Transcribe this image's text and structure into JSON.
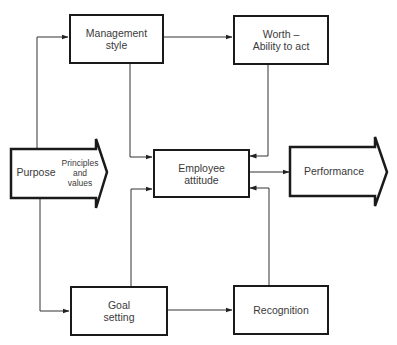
{
  "diagram": {
    "nodes": {
      "management": {
        "label_line1": "Management",
        "label_line2": "style"
      },
      "worth": {
        "label_line1": "Worth –",
        "label_line2": "Ability to act"
      },
      "purpose": {
        "label": "Purpose",
        "sub_line1": "Principles",
        "sub_line2": "and",
        "sub_line3": "values"
      },
      "employee": {
        "label_line1": "Employee",
        "label_line2": "attitude"
      },
      "performance": {
        "label": "Performance"
      },
      "goal": {
        "label_line1": "Goal",
        "label_line2": "setting"
      },
      "recognition": {
        "label": "Recognition"
      }
    },
    "edges": [
      {
        "from": "purpose",
        "to": "management"
      },
      {
        "from": "purpose",
        "to": "goal"
      },
      {
        "from": "management",
        "to": "worth"
      },
      {
        "from": "management",
        "to": "employee"
      },
      {
        "from": "worth",
        "to": "employee"
      },
      {
        "from": "goal",
        "to": "employee"
      },
      {
        "from": "goal",
        "to": "recognition"
      },
      {
        "from": "recognition",
        "to": "employee"
      },
      {
        "from": "employee",
        "to": "performance"
      }
    ]
  }
}
